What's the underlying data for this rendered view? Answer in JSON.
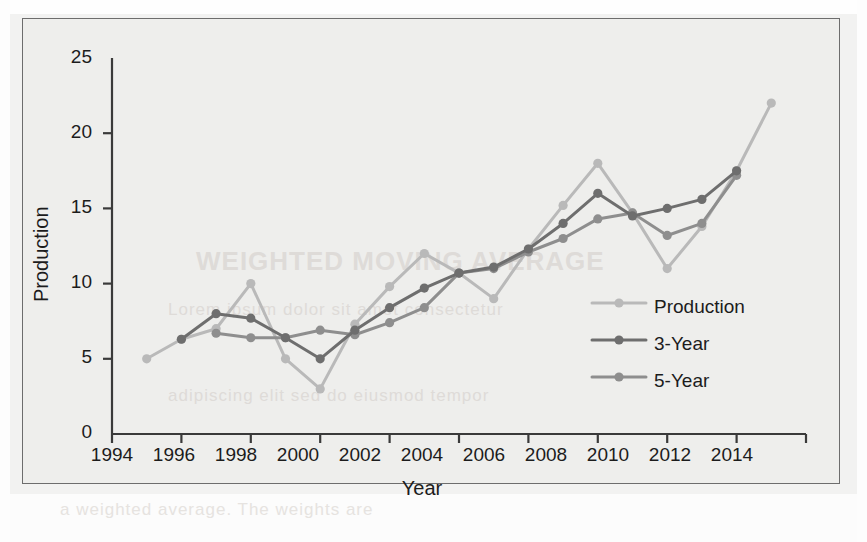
{
  "chart_data": {
    "type": "line",
    "title": "",
    "xlabel": "Year",
    "ylabel": "Production",
    "xlim": [
      1994,
      2014
    ],
    "ylim": [
      0,
      25
    ],
    "xticks": [
      1994,
      1996,
      1998,
      2000,
      2002,
      2004,
      2006,
      2008,
      2010,
      2012,
      2014
    ],
    "yticks": [
      0,
      5,
      10,
      15,
      20,
      25
    ],
    "grid": false,
    "legend_position": "inside-right",
    "series": [
      {
        "name": "Production",
        "color": "#b9b9b9",
        "x": [
          1995,
          1996,
          1997,
          1998,
          1999,
          2000,
          2001,
          2002,
          2003,
          2004,
          2005,
          2006,
          2007,
          2008,
          2009,
          2010,
          2011,
          2012,
          2013
        ],
        "values": [
          5,
          6.3,
          7,
          10,
          5,
          3,
          7.3,
          9.8,
          12,
          10.7,
          9,
          12.3,
          15.2,
          18,
          14.7,
          11,
          13.8,
          17.5,
          22
        ]
      },
      {
        "name": "3-Year",
        "color": "#6e6e6e",
        "x": [
          1996,
          1997,
          1998,
          1999,
          2000,
          2001,
          2002,
          2003,
          2004,
          2005,
          2006,
          2007,
          2008,
          2009,
          2010,
          2011,
          2012
        ],
        "values": [
          6.3,
          8.0,
          7.7,
          6.4,
          5.0,
          6.9,
          8.4,
          9.7,
          10.7,
          11.1,
          12.3,
          14.0,
          16.0,
          14.5,
          15.0,
          15.6,
          17.5
        ]
      },
      {
        "name": "5-Year",
        "color": "#8e8e8e",
        "x": [
          1997,
          1998,
          1999,
          2000,
          2001,
          2002,
          2003,
          2004,
          2005,
          2006,
          2007,
          2008,
          2009,
          2010,
          2011,
          2012
        ],
        "values": [
          6.7,
          6.4,
          6.4,
          6.9,
          6.6,
          7.4,
          8.4,
          10.7,
          11.0,
          12.1,
          13.0,
          14.3,
          14.7,
          13.2,
          14.0,
          17.2
        ]
      }
    ]
  },
  "axes": {
    "y_title": "Production",
    "x_title": "Year",
    "x_tick_labels": [
      "1994",
      "1996",
      "1998",
      "2000",
      "2002",
      "2004",
      "2006",
      "2008",
      "2010",
      "2012",
      "2014"
    ],
    "y_tick_labels": [
      "0",
      "5",
      "10",
      "15",
      "20",
      "25"
    ]
  },
  "legend": {
    "entries": [
      {
        "label": "Production",
        "color": "#b9b9b9"
      },
      {
        "label": "3-Year",
        "color": "#6e6e6e"
      },
      {
        "label": "5-Year",
        "color": "#8e8e8e"
      }
    ]
  },
  "background": {
    "ghost_lines": [
      "WEIGHTED MOVING AVERAGE",
      "Lorem ipsum dolor sit amet consectetur",
      "adipiscing elit sed do eiusmod tempor",
      "a weighted average. The weights are"
    ]
  },
  "colors": {
    "frame": "#6d6d6d",
    "axis": "#3a3a3a",
    "text": "#1c1c1c",
    "plot_bg": "#eeeeec"
  }
}
